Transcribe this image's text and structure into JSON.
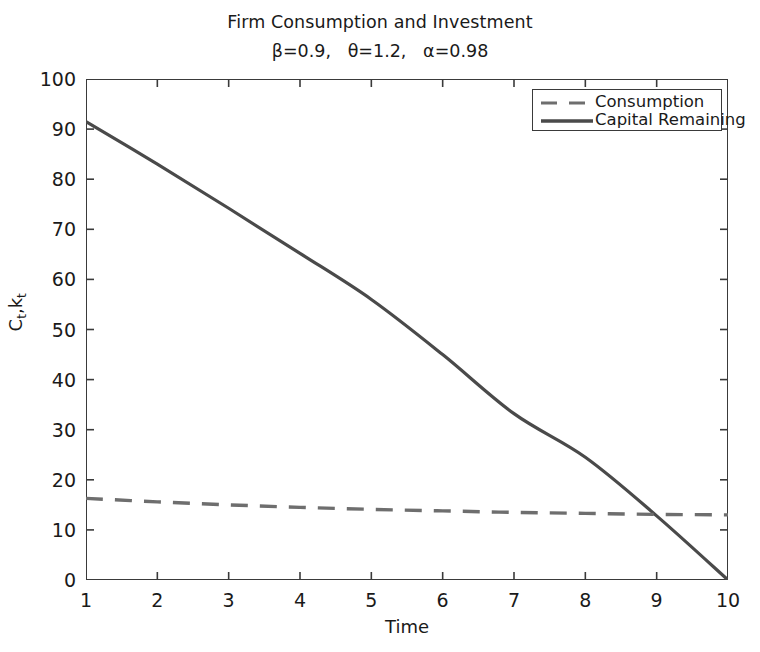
{
  "chart_data": {
    "type": "line",
    "title": "Firm Consumption and Investment",
    "subtitle": "β=0.9,   θ=1.2,   α=0.98",
    "xlabel": "Time",
    "ylabel": "C",
    "ylabel_sub1": "t",
    "ylabel_mid": ",k",
    "ylabel_sub2": "t",
    "ylabel_full": "C_t,k_t",
    "x": [
      1,
      2,
      3,
      4,
      5,
      6,
      7,
      8,
      9,
      10
    ],
    "xlim": [
      1,
      10
    ],
    "ylim": [
      0,
      100
    ],
    "xticks": [
      "1",
      "2",
      "3",
      "4",
      "5",
      "6",
      "7",
      "8",
      "9",
      "10"
    ],
    "yticks": [
      "0",
      "10",
      "20",
      "30",
      "40",
      "50",
      "60",
      "70",
      "80",
      "90",
      "100"
    ],
    "grid": false,
    "legend_position": "upper-right",
    "series": [
      {
        "name": "Consumption",
        "style": "dashed",
        "color": "#6e6e6e",
        "values": [
          16.3,
          15.6,
          15.0,
          14.5,
          14.1,
          13.8,
          13.5,
          13.3,
          13.1,
          13.0
        ]
      },
      {
        "name": "Capital Remaining",
        "style": "solid",
        "color": "#4a4a4a",
        "values": [
          91.5,
          83.0,
          74.2,
          65.2,
          56.0,
          45.0,
          33.2,
          24.5,
          12.8,
          0.0
        ]
      }
    ]
  },
  "legend": {
    "items": [
      {
        "label": "Consumption"
      },
      {
        "label": "Capital Remaining"
      }
    ]
  },
  "colors": {
    "axis": "#3a3a3a",
    "text": "#1a1a1a",
    "consumption": "#6e6e6e",
    "capital": "#4a4a4a",
    "background": "#ffffff"
  }
}
